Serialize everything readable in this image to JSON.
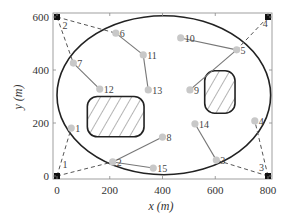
{
  "chart_data": {
    "type": "scatter",
    "title": "",
    "xlabel": "x (m)",
    "ylabel": "y (m)",
    "xlim": [
      0,
      800
    ],
    "ylim": [
      0,
      600
    ],
    "x_ticks": [
      "0",
      "200",
      "400",
      "600",
      "800"
    ],
    "y_ticks": [
      "0",
      "200",
      "400",
      "600"
    ],
    "grid": false,
    "colors": {
      "frame": "#888888",
      "ellipse": "#222222",
      "obstacle": "#222222",
      "sensor": "#c8c8c8",
      "sink": "#111111",
      "solid_link": "#777777",
      "dashed_link": "#555555"
    },
    "boundary_ellipse": {
      "cx": 405,
      "cy": 305,
      "rx": 405,
      "ry": 300
    },
    "obstacles": [
      {
        "x0": 115,
        "y0": 148,
        "x1": 330,
        "y1": 300
      },
      {
        "x0": 560,
        "y0": 237,
        "x1": 675,
        "y1": 397
      }
    ],
    "sinks": [
      {
        "id": "1",
        "x": 0,
        "y": 0,
        "label_x": 30,
        "label_y": 40
      },
      {
        "id": "2",
        "x": 0,
        "y": 600,
        "label_x": 30,
        "label_y": 565
      },
      {
        "id": "3",
        "x": 800,
        "y": 0,
        "label_x": 775,
        "label_y": 30
      },
      {
        "id": "4",
        "x": 800,
        "y": 600,
        "label_x": 790,
        "label_y": 575
      }
    ],
    "sensors": [
      {
        "id": "1",
        "x": 54,
        "y": 181
      },
      {
        "id": "2",
        "x": 211,
        "y": 53
      },
      {
        "id": "3",
        "x": 604,
        "y": 60
      },
      {
        "id": "4",
        "x": 750,
        "y": 208
      },
      {
        "id": "5",
        "x": 681,
        "y": 476
      },
      {
        "id": "6",
        "x": 223,
        "y": 539
      },
      {
        "id": "7",
        "x": 62,
        "y": 426
      },
      {
        "id": "8",
        "x": 400,
        "y": 147
      },
      {
        "id": "9",
        "x": 504,
        "y": 325
      },
      {
        "id": "10",
        "x": 469,
        "y": 521
      },
      {
        "id": "11",
        "x": 327,
        "y": 457
      },
      {
        "id": "12",
        "x": 162,
        "y": 328
      },
      {
        "id": "13",
        "x": 346,
        "y": 325
      },
      {
        "id": "14",
        "x": 523,
        "y": 197
      },
      {
        "id": "15",
        "x": 365,
        "y": 30
      }
    ],
    "solid_links": [
      [
        "6",
        "11"
      ],
      [
        "11",
        "13"
      ],
      [
        "7",
        "12"
      ],
      [
        "10",
        "5"
      ],
      [
        "5",
        "9"
      ],
      [
        "2",
        "8"
      ],
      [
        "2",
        "15"
      ],
      [
        "14",
        "3"
      ]
    ],
    "dashed_links": [
      [
        "sink1",
        "1"
      ],
      [
        "sink1",
        "2"
      ],
      [
        "sink2",
        "7"
      ],
      [
        "sink2",
        "6"
      ],
      [
        "sink3",
        "3"
      ],
      [
        "sink3",
        "4"
      ],
      [
        "sink4",
        "5"
      ]
    ]
  }
}
